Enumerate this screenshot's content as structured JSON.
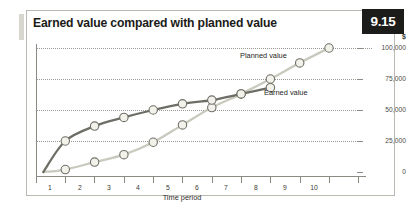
{
  "figure": {
    "number_badge": "9.15",
    "title": "Earned value compared with planned value"
  },
  "chart_data": {
    "type": "line",
    "title": "Earned value compared with planned value",
    "xlabel": "Time period",
    "ylabel": "$",
    "x": [
      1,
      2,
      3,
      4,
      5,
      6,
      7,
      8,
      9,
      10
    ],
    "xtick_labels": [
      "1",
      "2",
      "3",
      "4",
      "5",
      "6",
      "7",
      "8",
      "9",
      "10"
    ],
    "ytick_labels": [
      "0",
      "25,000",
      "50,000",
      "75,000",
      "100,000"
    ],
    "ytick_values": [
      0,
      25000,
      50000,
      75000,
      100000
    ],
    "ylim": [
      0,
      100000
    ],
    "xlim": [
      0,
      11
    ],
    "grid": "horizontal-dotted",
    "legend": "inline-annotations",
    "series": [
      {
        "name": "Planned value",
        "color": "#c9c9be",
        "marker": "circle",
        "x": [
          1,
          2,
          3,
          4,
          5,
          6,
          7,
          8,
          9,
          10
        ],
        "values": [
          2000,
          8000,
          14000,
          24000,
          38000,
          52000,
          63000,
          75000,
          88000,
          100000
        ]
      },
      {
        "name": "Earned value",
        "color": "#6e6e66",
        "marker": "circle",
        "x": [
          1,
          2,
          3,
          4,
          5,
          6,
          7,
          8
        ],
        "values": [
          25000,
          37000,
          44000,
          50000,
          55000,
          58000,
          63000,
          68000
        ]
      }
    ],
    "annotations": [
      {
        "text": "Planned value",
        "x": 9.0,
        "y": 94000
      },
      {
        "text": "Earned value",
        "x": 8.4,
        "y": 69000
      }
    ]
  },
  "axis": {
    "y_unit": "$",
    "y_labels": [
      "100,000",
      "75,000",
      "50,000",
      "25,000",
      "0"
    ],
    "x_labels": [
      "1",
      "2",
      "3",
      "4",
      "5",
      "6",
      "7",
      "8",
      "9",
      "10"
    ],
    "x_title": "Time period"
  },
  "colors": {
    "badge_bg": "#1c1c1a",
    "badge_text": "#ffffff",
    "planned_line": "#c9c9be",
    "earned_line": "#6e6e66",
    "marker_fill": "#f2f1ea",
    "marker_stroke": "#6f6f67",
    "grid": "#9a9a93",
    "frame": "#b9b9b2",
    "title_accent": "#d7d7cf"
  }
}
